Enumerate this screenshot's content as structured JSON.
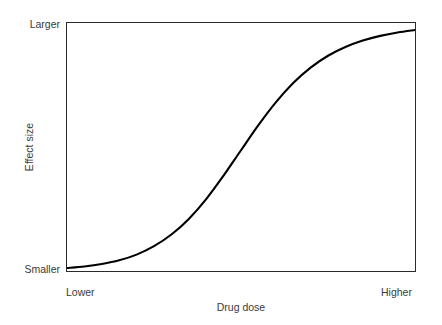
{
  "chart_data": {
    "type": "line",
    "title": "",
    "subtitle": "",
    "xlabel": "Drug dose",
    "ylabel": "Effect size",
    "xticklabels": [
      "Lower",
      "Higher"
    ],
    "yticklabels": [
      "Smaller",
      "Larger"
    ],
    "xlim": [
      0,
      1
    ],
    "ylim": [
      0,
      1
    ],
    "grid": false,
    "legend": null,
    "legend_position": "none",
    "annotations": [],
    "series": [
      {
        "name": "dose-response",
        "shape": "sigmoid",
        "color": "#000000",
        "linewidth": 2,
        "x": [
          0.0,
          0.05,
          0.1,
          0.15,
          0.2,
          0.25,
          0.3,
          0.35,
          0.4,
          0.45,
          0.5,
          0.55,
          0.6,
          0.65,
          0.7,
          0.75,
          0.8,
          0.85,
          0.9,
          0.95,
          1.0
        ],
        "y": [
          0.012,
          0.018,
          0.028,
          0.043,
          0.066,
          0.1,
          0.147,
          0.21,
          0.29,
          0.385,
          0.487,
          0.588,
          0.68,
          0.758,
          0.82,
          0.868,
          0.903,
          0.929,
          0.948,
          0.962,
          0.972
        ]
      }
    ]
  },
  "figure": {
    "background": "#ffffff",
    "axes_color": "#2b2b2b",
    "text_color": "#3a3a3a"
  }
}
